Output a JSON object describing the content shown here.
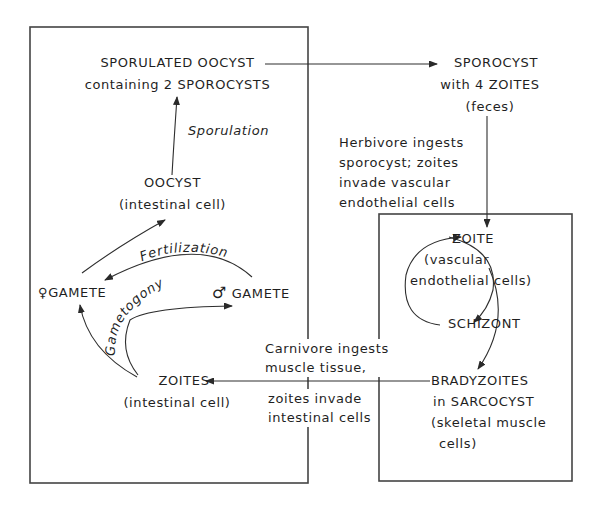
{
  "diagram": {
    "nodes": {
      "sporulated_oocyst": {
        "line1": "SPORULATED OOCYST",
        "line2": "containing 2 SPOROCYSTS"
      },
      "sporocyst": {
        "line1": "SPOROCYST",
        "line2": "with 4 ZOITES",
        "line3": "(feces)"
      },
      "oocyst": {
        "line1": "OOCYST",
        "line2": "(intestinal cell)"
      },
      "female_gamete": {
        "symbol": "♀",
        "label": "GAMETE"
      },
      "male_gamete": {
        "symbol": "♂",
        "label": "GAMETE"
      },
      "zoites_intestinal": {
        "line1": "ZOITES",
        "line2": "(intestinal cell)"
      },
      "zoite_vascular": {
        "line1": "ZOITE",
        "line2": "(vascular",
        "line3": "endothelial cells)"
      },
      "schizont": {
        "label": "SCHIZONT"
      },
      "bradyzoites": {
        "line1": "BRADYZOITES",
        "line2": "in SARCOCYST",
        "line3": "(skeletal muscle",
        "line4": "cells)"
      }
    },
    "edge_labels": {
      "sporulation": "Sporulation",
      "fertilization": "Fertilization",
      "gametogony": "Gametogony",
      "herbivore": [
        "Herbivore ingests",
        "sporocyst; zoites",
        "invade vascular",
        "endothelial cells"
      ],
      "carnivore_top": [
        "Carnivore ingests",
        "muscle tissue,"
      ],
      "carnivore_bottom": [
        "zoites invade",
        "intestinal cells"
      ]
    },
    "colors": {
      "line": "#3a3a3a",
      "text": "#1f1f1f",
      "background": "#ffffff"
    }
  }
}
